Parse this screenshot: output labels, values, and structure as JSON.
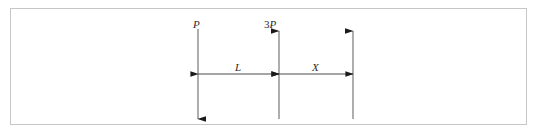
{
  "figure": {
    "type": "beam-loading-diagram",
    "background_color": "#ffffff",
    "border_color": "#c6c6c6",
    "line_color": "#6b6b6b",
    "arrow_color": "#1a1a1a",
    "text_color": "#2b2b2b"
  },
  "forces": [
    {
      "id": "force-p",
      "label": "P",
      "label_prefix": "",
      "direction": "down",
      "x": 197,
      "top_y": 28,
      "bottom_y": 118,
      "arrowhead_at": "bottom"
    },
    {
      "id": "force-3p",
      "label": "P",
      "label_prefix": "3",
      "direction": "up",
      "x": 278,
      "top_y": 30,
      "bottom_y": 118,
      "arrowhead_at": "top"
    },
    {
      "id": "force-reaction",
      "label": "",
      "label_prefix": "",
      "direction": "up",
      "x": 352,
      "top_y": 30,
      "bottom_y": 118,
      "arrowhead_at": "top"
    }
  ],
  "dimensions": [
    {
      "id": "dimension-l",
      "label": "L",
      "from_x": 197,
      "to_x": 278,
      "y": 73,
      "style": "double-arrow"
    },
    {
      "id": "dimension-x",
      "label": "X",
      "from_x": 278,
      "to_x": 352,
      "y": 73,
      "style": "double-arrow"
    }
  ]
}
